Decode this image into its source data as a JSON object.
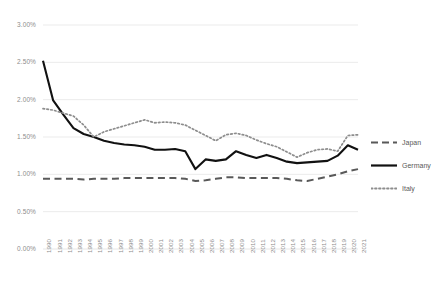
{
  "chart_data": {
    "type": "line",
    "title": "",
    "xlabel": "",
    "ylabel": "",
    "ylim": [
      0,
      0.03
    ],
    "ytick_labels": [
      "0.00%",
      "0.50%",
      "1.00%",
      "1.50%",
      "2.00%",
      "2.50%",
      "3.00%"
    ],
    "ytick_values": [
      0.0,
      0.005,
      0.01,
      0.015,
      0.02,
      0.025,
      0.03
    ],
    "grid": true,
    "legend_position": "right",
    "categories": [
      "1990",
      "1991",
      "1992",
      "1993",
      "1994",
      "1995",
      "1996",
      "1997",
      "1998",
      "1999",
      "2000",
      "2001",
      "2002",
      "2003",
      "2004",
      "2005",
      "2006",
      "2007",
      "2008",
      "2009",
      "2010",
      "2011",
      "2012",
      "2013",
      "2014",
      "2015",
      "2016",
      "2017",
      "2018",
      "2019",
      "2020",
      "2021"
    ],
    "series": [
      {
        "name": "Japan",
        "style": "dashed",
        "color": "#595959",
        "values": [
          0.0094,
          0.0094,
          0.0094,
          0.0094,
          0.0093,
          0.0094,
          0.0094,
          0.0094,
          0.0095,
          0.0095,
          0.0095,
          0.0095,
          0.0095,
          0.0095,
          0.0094,
          0.0091,
          0.0092,
          0.0094,
          0.0096,
          0.0096,
          0.0095,
          0.0095,
          0.0095,
          0.0095,
          0.0094,
          0.0092,
          0.0091,
          0.0094,
          0.0097,
          0.01,
          0.0104,
          0.0107
        ]
      },
      {
        "name": "Germany",
        "style": "solid",
        "color": "#111111",
        "values": [
          0.0252,
          0.0199,
          0.018,
          0.0162,
          0.0154,
          0.015,
          0.0145,
          0.0142,
          0.014,
          0.0139,
          0.0137,
          0.0133,
          0.0133,
          0.0134,
          0.0131,
          0.0107,
          0.012,
          0.0118,
          0.012,
          0.0131,
          0.0126,
          0.0122,
          0.0126,
          0.0122,
          0.0117,
          0.0115,
          0.0116,
          0.0117,
          0.0118,
          0.0125,
          0.0139,
          0.0133
        ]
      },
      {
        "name": "Italy",
        "style": "dotted",
        "color": "#8d8d8d",
        "values": [
          0.0188,
          0.0186,
          0.0182,
          0.0178,
          0.0166,
          0.015,
          0.0157,
          0.0161,
          0.0165,
          0.0169,
          0.0173,
          0.0169,
          0.017,
          0.0169,
          0.0166,
          0.0159,
          0.0152,
          0.0145,
          0.0153,
          0.0155,
          0.0152,
          0.0146,
          0.0141,
          0.0137,
          0.013,
          0.0123,
          0.0129,
          0.0133,
          0.0134,
          0.0131,
          0.0152,
          0.0153
        ]
      }
    ]
  },
  "legend": {
    "items": [
      {
        "label": "Japan",
        "key": "dashed-line-key"
      },
      {
        "label": "Germany",
        "key": "solid-line-key"
      },
      {
        "label": "Italy",
        "key": "dotted-line-key"
      }
    ]
  }
}
